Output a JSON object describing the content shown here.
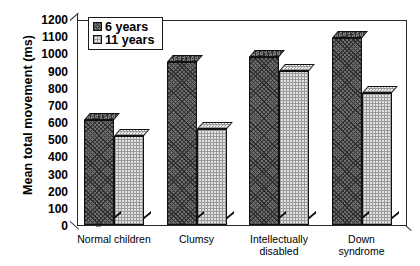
{
  "chart_data": {
    "type": "bar",
    "title": "",
    "xlabel": "",
    "ylabel": "Mean total movement (ms)",
    "ylim": [
      0,
      1200
    ],
    "ytick_step": 100,
    "yticks": [
      0,
      100,
      200,
      300,
      400,
      500,
      600,
      700,
      800,
      900,
      1000,
      1100,
      1200
    ],
    "ytick_labels": [
      "0",
      "100",
      "200",
      "300",
      "400",
      "500",
      "600",
      "700",
      "800",
      "900",
      "1000",
      "1100",
      "1200"
    ],
    "grid": false,
    "legend_position": "top-left",
    "categories": [
      "Normal children",
      "Clumsy",
      "Intellectually\ndisabled",
      "Down syndrome"
    ],
    "series": [
      {
        "name": "6 years",
        "values": [
          610,
          950,
          980,
          1090
        ]
      },
      {
        "name": "11 years",
        "values": [
          520,
          560,
          900,
          770
        ]
      }
    ]
  },
  "legend": {
    "items": [
      {
        "label": "6 years",
        "swatch": "dark-hatched-swatch"
      },
      {
        "label": "11 years",
        "swatch": "light-dotted-swatch"
      }
    ]
  }
}
